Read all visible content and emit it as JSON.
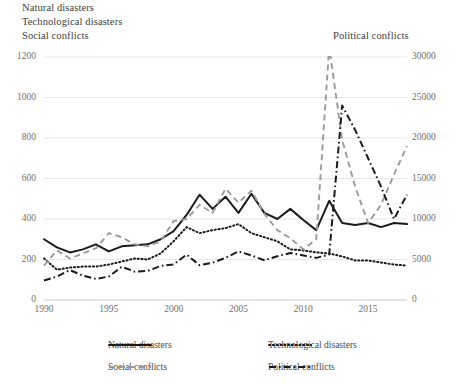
{
  "titles": {
    "natural": "Natural disasters",
    "technological": "Technological disasters",
    "social": "Social conflicts",
    "political": "Political conflicts"
  },
  "axes": {
    "left_ticks": [
      "1200",
      "1000",
      "800",
      "600",
      "400",
      "200",
      "0"
    ],
    "right_ticks": [
      "30000",
      "25000",
      "20000",
      "15000",
      "10000",
      "5000",
      "0"
    ],
    "x_ticks": [
      "1990",
      "1995",
      "2000",
      "2005",
      "2010",
      "2015"
    ]
  },
  "legend": [
    {
      "label": "Natural disasters",
      "style": "solid",
      "color": "#1a1a1a"
    },
    {
      "label": "Technological disasters",
      "style": "dotted",
      "color": "#1a1a1a"
    },
    {
      "label": "Social conflicts",
      "style": "dashed",
      "color": "#9a9a9a"
    },
    {
      "label": "Political conflicts",
      "style": "dashdot",
      "color": "#1a1a1a"
    }
  ],
  "chart_data": {
    "type": "line",
    "title": "",
    "xlabel": "",
    "ylabel": "",
    "y_left_label": "Natural disasters / Technological disasters / Social conflicts",
    "y_right_label": "Political conflicts",
    "xlim": [
      1990,
      2018
    ],
    "ylim_left": [
      0,
      1200
    ],
    "ylim_right": [
      0,
      30000
    ],
    "grid": true,
    "legend_position": "bottom",
    "x": [
      1990,
      1991,
      1992,
      1993,
      1994,
      1995,
      1996,
      1997,
      1998,
      1999,
      2000,
      2001,
      2002,
      2003,
      2004,
      2005,
      2006,
      2007,
      2008,
      2009,
      2010,
      2011,
      2012,
      2013,
      2014,
      2015,
      2016,
      2017,
      2018
    ],
    "series": [
      {
        "name": "Natural disasters",
        "axis": "left",
        "style": "solid",
        "color": "#1a1a1a",
        "values": [
          300,
          260,
          235,
          250,
          275,
          240,
          265,
          270,
          275,
          300,
          340,
          420,
          520,
          450,
          510,
          430,
          525,
          430,
          400,
          450,
          395,
          345,
          490,
          380,
          370,
          380,
          360,
          380,
          375
        ]
      },
      {
        "name": "Technological disasters",
        "axis": "left",
        "style": "dotted",
        "color": "#1a1a1a",
        "values": [
          205,
          150,
          160,
          165,
          165,
          175,
          190,
          205,
          200,
          230,
          290,
          360,
          330,
          345,
          355,
          375,
          330,
          310,
          290,
          250,
          245,
          235,
          230,
          215,
          195,
          195,
          185,
          175,
          170
        ]
      },
      {
        "name": "Social conflicts",
        "axis": "left",
        "style": "dashed",
        "color": "#9a9a9a",
        "values": [
          170,
          245,
          205,
          230,
          255,
          330,
          310,
          275,
          265,
          290,
          390,
          400,
          470,
          430,
          550,
          480,
          540,
          425,
          345,
          305,
          250,
          300,
          1250,
          790,
          560,
          380,
          470,
          620,
          760
        ]
      },
      {
        "name": "Political conflicts",
        "axis": "right",
        "style": "dashdot",
        "color": "#1a1a1a",
        "values": [
          2400,
          2900,
          3700,
          3000,
          2600,
          2900,
          4100,
          3500,
          3600,
          4200,
          4400,
          5600,
          4300,
          4600,
          5200,
          6000,
          5500,
          4900,
          5400,
          5800,
          5500,
          5200,
          5600,
          24000,
          21000,
          17500,
          14000,
          10000,
          13000
        ]
      }
    ]
  }
}
